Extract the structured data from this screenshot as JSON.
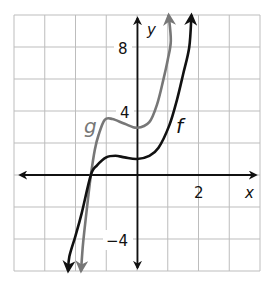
{
  "chart_data": {
    "type": "line",
    "title": "",
    "xlabel": "x",
    "ylabel": "y",
    "xlim": [
      -4,
      4
    ],
    "ylim": [
      -6,
      10
    ],
    "grid": true,
    "grid_step": {
      "x": 1,
      "y": 2
    },
    "x_tick_labels": [
      {
        "value": 2,
        "label": "2"
      }
    ],
    "y_tick_labels": [
      {
        "value": 8,
        "label": "8"
      },
      {
        "value": 4,
        "label": "4"
      },
      {
        "value": -4,
        "label": "−4"
      }
    ],
    "legend": "none (curves labeled inline)",
    "series": [
      {
        "name": "f",
        "color": "#111111",
        "points": [
          [
            -2.24,
            -6
          ],
          [
            -2.2,
            -5.1
          ],
          [
            -2.0,
            -3.8
          ],
          [
            -1.8,
            -2.4
          ],
          [
            -1.5,
            0
          ],
          [
            -1.3,
            0.6
          ],
          [
            -1.0,
            1.1
          ],
          [
            -0.7,
            1.2
          ],
          [
            -0.4,
            1.1
          ],
          [
            0,
            1.0
          ],
          [
            0.4,
            1.2
          ],
          [
            0.7,
            1.7
          ],
          [
            1.05,
            3.1
          ],
          [
            1.3,
            4.7
          ],
          [
            1.5,
            6.3
          ],
          [
            1.7,
            8.0
          ],
          [
            1.77,
            10
          ]
        ]
      },
      {
        "name": "g",
        "color": "#777777",
        "points": [
          [
            -1.82,
            -6
          ],
          [
            -1.75,
            -4.2
          ],
          [
            -1.6,
            -1.6
          ],
          [
            -1.5,
            0
          ],
          [
            -1.37,
            1.6
          ],
          [
            -1.25,
            2.5
          ],
          [
            -1.05,
            3.45
          ],
          [
            -0.8,
            3.5
          ],
          [
            -0.4,
            3.2
          ],
          [
            0,
            2.95
          ],
          [
            0.4,
            3.3
          ],
          [
            0.65,
            4.4
          ],
          [
            0.85,
            5.9
          ],
          [
            1.0,
            7.2
          ],
          [
            1.1,
            8.4
          ],
          [
            1.03,
            10
          ]
        ]
      }
    ],
    "annotations": [
      {
        "text": "f",
        "x": 1.45,
        "y": 3.0
      },
      {
        "text": "g",
        "x": -1.6,
        "y": 2.8
      }
    ]
  },
  "labels": {
    "x_axis": "x",
    "y_axis": "y",
    "tick_8": "8",
    "tick_4": "4",
    "tick_neg4": "−4",
    "tick_2": "2",
    "curve_f": "f",
    "curve_g": "g"
  }
}
